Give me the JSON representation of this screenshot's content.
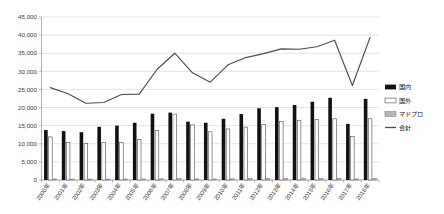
{
  "chart_data": {
    "type": "bar",
    "title": "",
    "xlabel": "",
    "ylabel": "",
    "ylim": [
      0,
      45000
    ],
    "ytick_values": [
      0,
      5000,
      10000,
      15000,
      20000,
      25000,
      30000,
      35000,
      40000,
      45000
    ],
    "ytick_labels": [
      "0",
      "5,000",
      "10,000",
      "15,000",
      "20,000",
      "25,000",
      "30,000",
      "35,000",
      "40,000",
      "45,000"
    ],
    "grid": true,
    "legend_position": "right",
    "categories": [
      "2000年",
      "2001年",
      "2002年",
      "2003年",
      "2004年",
      "2005年",
      "2006年",
      "2007年",
      "2008年",
      "2009年",
      "2010年",
      "2011年",
      "2012年",
      "2013年",
      "2014年",
      "2015年",
      "2016年",
      "2017年",
      "2018年"
    ],
    "series": [
      {
        "name": "国内",
        "type": "bar",
        "color": "#111111",
        "values": [
          13800,
          13500,
          13200,
          14700,
          15000,
          15800,
          18300,
          18600,
          16100,
          15800,
          16900,
          18200,
          19800,
          20100,
          20700,
          21600,
          22700,
          15500,
          22400
        ]
      },
      {
        "name": "国外",
        "type": "bar",
        "color": "#ffffff",
        "values": [
          11900,
          10300,
          10100,
          10400,
          10300,
          11200,
          13700,
          18200,
          15200,
          13300,
          14100,
          14600,
          15300,
          16100,
          16500,
          16700,
          16900,
          12000,
          16900
        ]
      },
      {
        "name": "マドプロ",
        "type": "bar",
        "color": "#b8b8b8",
        "values": [
          300,
          260,
          240,
          260,
          280,
          300,
          330,
          360,
          320,
          300,
          330,
          360,
          380,
          400,
          420,
          440,
          460,
          320,
          470
        ]
      },
      {
        "name": "合計",
        "type": "line",
        "color": "#4d4d4d",
        "values": [
          25500,
          23800,
          21200,
          21400,
          23600,
          23700,
          30500,
          35000,
          29600,
          27000,
          31800,
          33800,
          34900,
          36200,
          36100,
          36800,
          38600,
          26100,
          39400
        ]
      }
    ],
    "legend": [
      "国内",
      "国外",
      "マドプロ",
      "合計"
    ]
  }
}
